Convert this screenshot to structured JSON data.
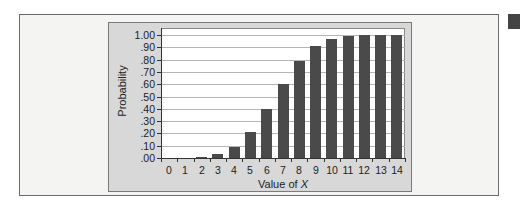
{
  "chart_data": {
    "type": "bar",
    "title": "",
    "xlabel": "Value of X",
    "xlabel_prefix": "Value of ",
    "xlabel_var": "X",
    "ylabel": "Probability",
    "ylim": [
      0,
      1
    ],
    "grid": true,
    "legend": null,
    "categories": [
      "0",
      "1",
      "2",
      "3",
      "4",
      "5",
      "6",
      "7",
      "8",
      "9",
      "10",
      "11",
      "12",
      "13",
      "14"
    ],
    "values": [
      0.0,
      0.0,
      0.01,
      0.03,
      0.09,
      0.21,
      0.4,
      0.6,
      0.79,
      0.91,
      0.97,
      0.99,
      1.0,
      1.0,
      1.0
    ],
    "yticks": [
      "1.00",
      ".90",
      ".80",
      ".70",
      ".60",
      ".50",
      ".40",
      ".30",
      ".20",
      ".10",
      ".00"
    ],
    "ytick_values": [
      1.0,
      0.9,
      0.8,
      0.7,
      0.6,
      0.5,
      0.4,
      0.3,
      0.2,
      0.1,
      0.0
    ],
    "colors": {
      "bar": "#4a4a4a",
      "panel": "#d8d8d8",
      "plot_bg": "#ffffff",
      "grid": "#b5b5b5"
    }
  }
}
